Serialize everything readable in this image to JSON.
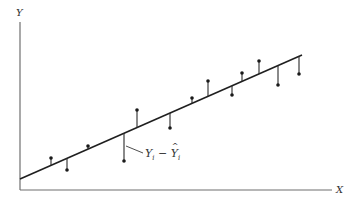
{
  "diagram": {
    "title": "",
    "type": "regression-residuals",
    "y_axis_label": "Y",
    "x_axis_label": "X",
    "residual_label": {
      "lhs": "Y",
      "lhs_sub": "i",
      "op": "−",
      "rhs": "Y",
      "rhs_sub": "i",
      "rhs_hat": true
    },
    "colors": {
      "axis": "#6f6f6f",
      "line": "#1f1f1f",
      "points": "#1a1a1a"
    }
  },
  "chart_data": {
    "type": "scatter",
    "title": "",
    "xlabel": "X",
    "ylabel": "Y",
    "grid": false,
    "fitted_line": {
      "x1": 0,
      "y1": 11,
      "x2": 282,
      "y2": 135
    },
    "points": [
      {
        "x": 31,
        "y": 32,
        "fitted": 25
      },
      {
        "x": 47,
        "y": 20,
        "fitted": 32
      },
      {
        "x": 68,
        "y": 44,
        "fitted": 41
      },
      {
        "x": 104,
        "y": 29,
        "fitted": 57
      },
      {
        "x": 117,
        "y": 80,
        "fitted": 62
      },
      {
        "x": 150,
        "y": 62,
        "fitted": 77
      },
      {
        "x": 172,
        "y": 92,
        "fitted": 87
      },
      {
        "x": 188,
        "y": 109,
        "fitted": 94
      },
      {
        "x": 212,
        "y": 95,
        "fitted": 104
      },
      {
        "x": 222,
        "y": 117,
        "fitted": 109
      },
      {
        "x": 239,
        "y": 129,
        "fitted": 116
      },
      {
        "x": 258,
        "y": 105,
        "fitted": 125
      },
      {
        "x": 279,
        "y": 116,
        "fitted": 134
      }
    ],
    "annotations": [
      "Yi − Ŷi (residual)"
    ]
  }
}
